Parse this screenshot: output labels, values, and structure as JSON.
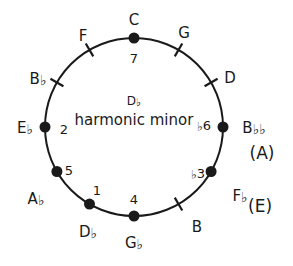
{
  "diagram": {
    "center": {
      "key": "D♭",
      "scale": "harmonic minor"
    },
    "geometry": {
      "cx": 134,
      "cy": 127,
      "radius": 89,
      "stroke_color": "#1a1a1a",
      "dot_color": "#1a1a1a",
      "background": "#ffffff"
    },
    "positions": [
      {
        "id": "c",
        "note": "C",
        "degree": "7",
        "marker": "dot",
        "angle_deg": 0,
        "note_x": 134,
        "note_y": 20,
        "degree_x": 134,
        "degree_y": 58
      },
      {
        "id": "g",
        "note": "G",
        "degree": "",
        "marker": "tick",
        "angle_deg": 30,
        "note_x": 184,
        "note_y": 33,
        "degree_x": 0,
        "degree_y": 0
      },
      {
        "id": "d",
        "note": "D",
        "degree": "",
        "marker": "tick",
        "angle_deg": 60,
        "note_x": 230,
        "note_y": 78,
        "degree_x": 0,
        "degree_y": 0
      },
      {
        "id": "bbb",
        "note": "B♭♭",
        "degree": "♭6",
        "marker": "dot",
        "angle_deg": 90,
        "note_x": 254,
        "note_y": 128,
        "degree_x": 204,
        "degree_y": 126,
        "enharmonic": "(A)",
        "enh_x": 262,
        "enh_y": 153
      },
      {
        "id": "fb",
        "note": "F♭",
        "degree": "♭3",
        "marker": "dot",
        "angle_deg": 120,
        "note_x": 240,
        "note_y": 196,
        "degree_x": 198,
        "degree_y": 174,
        "enharmonic": "(E)",
        "enh_x": 260,
        "enh_y": 206
      },
      {
        "id": "b",
        "note": "B",
        "degree": "",
        "marker": "tick",
        "angle_deg": 150,
        "note_x": 197,
        "note_y": 227,
        "degree_x": 0,
        "degree_y": 0
      },
      {
        "id": "gb",
        "note": "G♭",
        "degree": "4",
        "marker": "dot",
        "angle_deg": 180,
        "note_x": 134,
        "note_y": 243,
        "degree_x": 134,
        "degree_y": 199
      },
      {
        "id": "db",
        "note": "D♭",
        "degree": "1",
        "marker": "dot",
        "angle_deg": 210,
        "note_x": 88,
        "note_y": 232,
        "degree_x": 97,
        "degree_y": 190
      },
      {
        "id": "ab",
        "note": "A♭",
        "degree": "5",
        "marker": "dot",
        "angle_deg": 240,
        "note_x": 36,
        "note_y": 199,
        "degree_x": 69,
        "degree_y": 170
      },
      {
        "id": "eb",
        "note": "E♭",
        "degree": "2",
        "marker": "dot",
        "angle_deg": 270,
        "note_x": 25,
        "note_y": 128,
        "degree_x": 64,
        "degree_y": 129
      },
      {
        "id": "bb",
        "note": "B♭",
        "degree": "",
        "marker": "tick",
        "angle_deg": 300,
        "note_x": 38,
        "note_y": 79,
        "degree_x": 0,
        "degree_y": 0
      },
      {
        "id": "f",
        "note": "F",
        "degree": "",
        "marker": "tick",
        "angle_deg": 330,
        "note_x": 83,
        "note_y": 36,
        "degree_x": 0,
        "degree_y": 0
      }
    ]
  }
}
